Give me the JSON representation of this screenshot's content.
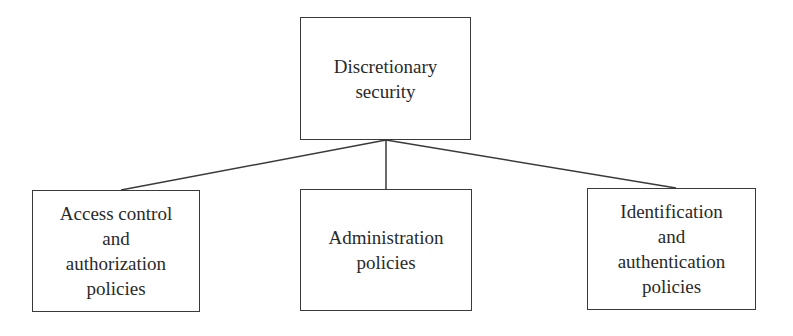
{
  "diagram": {
    "type": "tree",
    "root": {
      "id": "root",
      "label": "Discretionary\nsecurity"
    },
    "children": [
      {
        "id": "access",
        "label": "Access control\nand\nauthorization\npolicies"
      },
      {
        "id": "admin",
        "label": "Administration\npolicies"
      },
      {
        "id": "ident",
        "label": "Identification\nand\nauthentication\npolicies"
      }
    ],
    "edges": [
      {
        "from": "root",
        "to": "access"
      },
      {
        "from": "root",
        "to": "admin"
      },
      {
        "from": "root",
        "to": "ident"
      }
    ]
  }
}
